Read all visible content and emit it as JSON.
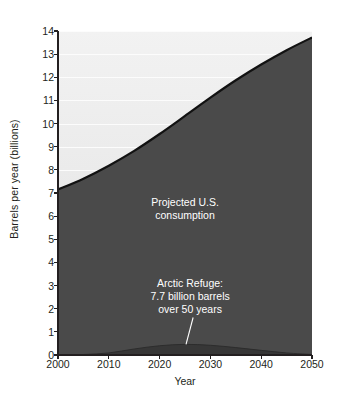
{
  "figure": {
    "background_color": "#ffffff",
    "plot_area": {
      "left": 58,
      "top": 31,
      "right": 312,
      "bottom": 355
    }
  },
  "colors": {
    "consumption_fill": "#4a4a4a",
    "upper_background_top": "#ededed",
    "upper_background_bottom": "#e2e2e2",
    "curve_line": "#111111",
    "arctic_fill": "#3a3a3a",
    "gridline": "#fbfbfb",
    "axis": "#231f20",
    "annotation_text": "#ffffff"
  },
  "axes": {
    "y_title": "Barrels per year (billions)",
    "x_title": "Year",
    "y_ticks": [
      0,
      1,
      2,
      3,
      4,
      5,
      6,
      7,
      8,
      9,
      10,
      11,
      12,
      13,
      14
    ],
    "y_tick_labels": [
      "0",
      "1",
      "2",
      "3",
      "4",
      "5",
      "6",
      "7",
      "8",
      "9",
      "10",
      "11",
      "12",
      "13",
      "14"
    ],
    "x_ticks": [
      2000,
      2010,
      2020,
      2030,
      2040,
      2050
    ],
    "x_tick_labels": [
      "2000",
      "2010",
      "2020",
      "2030",
      "2040",
      "2050"
    ],
    "xlim": [
      2000,
      2050
    ],
    "ylim": [
      0,
      14
    ],
    "grid": "horizontal-faint-in-upper-region"
  },
  "annotations": {
    "consumption": {
      "lines": [
        "Projected U.S.",
        "consumption"
      ],
      "x_year": 2025,
      "y_value": 6.45
    },
    "arctic": {
      "lines": [
        "Arctic Refuge:",
        "7.7 billion barrels",
        "over 50 years"
      ],
      "x_year": 2026,
      "y_value": 2.95,
      "leader_from": {
        "x_year": 2026.6,
        "y_value": 1.62
      },
      "leader_to": {
        "x_year": 2025.2,
        "y_value": 0.46
      }
    }
  },
  "caption_sliver": "",
  "chart_data": {
    "type": "area",
    "title": "",
    "xlabel": "Year",
    "ylabel": "Barrels per year (billions)",
    "xlim": [
      2000,
      2050
    ],
    "ylim": [
      0,
      14
    ],
    "grid": true,
    "legend": "inline-annotations",
    "x": [
      2000,
      2005,
      2010,
      2015,
      2020,
      2025,
      2030,
      2035,
      2040,
      2045,
      2050
    ],
    "series": [
      {
        "name": "Projected U.S. consumption",
        "type": "area",
        "color": "#4a4a4a",
        "values": [
          7.15,
          7.62,
          8.18,
          8.82,
          9.55,
          10.33,
          11.12,
          11.87,
          12.55,
          13.17,
          13.72
        ]
      },
      {
        "name": "Arctic Refuge: 7.7 billion barrels over 50 years",
        "type": "area",
        "color": "#3a3a3a",
        "values": [
          0.0,
          0.02,
          0.09,
          0.26,
          0.4,
          0.46,
          0.42,
          0.32,
          0.2,
          0.09,
          0.02
        ]
      }
    ],
    "notes": [
      "Arctic Refuge production is shown as a thin sliver at the bottom of the chart.",
      "The upper light region above the consumption curve is unfilled background."
    ]
  }
}
